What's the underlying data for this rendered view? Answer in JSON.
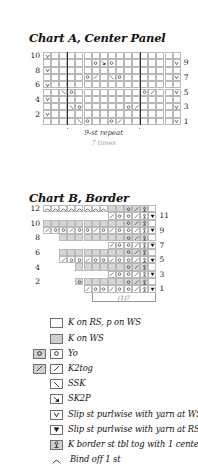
{
  "charts": [
    {
      "id": "chart-a",
      "title": "Chart A, Center Panel",
      "cols": 17,
      "rows": 10,
      "row_numbers_left": [
        "10",
        "8",
        "6",
        "4",
        "2"
      ],
      "row_numbers_right": [
        "9",
        "7",
        "5",
        "3",
        "1"
      ],
      "repeat_label": "9-st repeat",
      "repeat_sublabel": "7 times",
      "repeat_span_cols": [
        3,
        11
      ],
      "grid": [
        {
          "row": 10,
          "side": "WS",
          "cells": [
            "slip-ws",
            "k",
            "k",
            "k",
            "k",
            "k",
            "k",
            "k",
            "k",
            "k",
            "k",
            "k",
            "k",
            "k",
            "k",
            "k",
            "k"
          ]
        },
        {
          "row": 9,
          "side": "RS",
          "cells": [
            "k",
            "k",
            "k",
            "k",
            "k",
            "k",
            "yo",
            "sk2p",
            "yo",
            "k",
            "k",
            "k",
            "k",
            "k",
            "k",
            "k",
            "slip-ws"
          ]
        },
        {
          "row": 8,
          "side": "WS",
          "cells": [
            "slip-ws",
            "k",
            "k",
            "k",
            "k",
            "k",
            "k",
            "k",
            "k",
            "k",
            "k",
            "k",
            "k",
            "k",
            "k",
            "k",
            "k"
          ]
        },
        {
          "row": 7,
          "side": "RS",
          "cells": [
            "k",
            "k",
            "k",
            "k",
            "k",
            "yo",
            "k2tog",
            "k",
            "ssk",
            "yo",
            "k",
            "k",
            "k",
            "k",
            "k",
            "k",
            "slip-ws"
          ]
        },
        {
          "row": 6,
          "side": "WS",
          "cells": [
            "slip-ws",
            "k",
            "k",
            "k",
            "k",
            "k",
            "k",
            "k",
            "k",
            "k",
            "k",
            "k",
            "k",
            "k",
            "k",
            "k",
            "k"
          ]
        },
        {
          "row": 5,
          "side": "RS",
          "cells": [
            "k",
            "k",
            "ssk",
            "yo",
            "k",
            "k",
            "k",
            "k",
            "k",
            "k",
            "k",
            "k",
            "yo",
            "k2tog",
            "k",
            "k",
            "slip-ws"
          ]
        },
        {
          "row": 4,
          "side": "WS",
          "cells": [
            "slip-ws",
            "k",
            "k",
            "k",
            "k",
            "k",
            "k",
            "k",
            "k",
            "k",
            "k",
            "k",
            "k",
            "k",
            "k",
            "k",
            "k"
          ]
        },
        {
          "row": 3,
          "side": "RS",
          "cells": [
            "k",
            "k",
            "k",
            "ssk",
            "yo",
            "k",
            "k",
            "k",
            "k",
            "k",
            "yo",
            "k2tog",
            "k",
            "k",
            "k",
            "k",
            "slip-ws"
          ]
        },
        {
          "row": 2,
          "side": "WS",
          "cells": [
            "slip-ws",
            "k",
            "k",
            "k",
            "k",
            "k",
            "k",
            "k",
            "k",
            "k",
            "k",
            "k",
            "k",
            "k",
            "k",
            "k",
            "k"
          ]
        },
        {
          "row": 1,
          "side": "RS",
          "cells": [
            "k",
            "k",
            "k",
            "k",
            "ssk",
            "yo",
            "k",
            "k",
            "yo",
            "k2tog",
            "k",
            "k",
            "k",
            "k",
            "k",
            "k",
            "slip-ws"
          ]
        }
      ]
    },
    {
      "id": "chart-b",
      "title": "Chart B, Border",
      "cols": 14,
      "rows": 12,
      "row_numbers_left": [
        "12",
        "10",
        "8",
        "6",
        "4",
        "2"
      ],
      "row_numbers_right": [
        "11",
        "9",
        "7",
        "5",
        "3",
        "1"
      ],
      "bottom_label": "(1)7",
      "bottom_span_cols": [
        6,
        13
      ],
      "grid": [
        {
          "row": 12,
          "side": "WS",
          "cells": [
            "bindoff",
            "bindoff",
            "bindoff",
            "bindoff",
            "bindoff",
            "bindoff",
            "bindoff",
            "bindoff",
            "kws",
            "kws",
            "yo",
            "k2tog",
            "ktbl",
            "k"
          ]
        },
        {
          "row": 11,
          "side": "RS",
          "cells": [
            "none",
            "none",
            "none",
            "none",
            "none",
            "none",
            "none",
            "none",
            "k2tog",
            "yo",
            "yo",
            "k2tog",
            "ktbl",
            "slip-rs"
          ]
        },
        {
          "row": 10,
          "side": "WS",
          "cells": [
            "kws",
            "kws",
            "kws",
            "kws",
            "kws",
            "kws",
            "kws",
            "kws",
            "kws",
            "kws",
            "yo",
            "k2tog",
            "ktbl",
            "k"
          ]
        },
        {
          "row": 9,
          "side": "RS",
          "cells": [
            "k2tog",
            "yo",
            "yo",
            "k2tog",
            "yo",
            "yo",
            "k2tog",
            "yo",
            "k2tog",
            "yo",
            "yo",
            "k2tog",
            "ktbl",
            "slip-rs"
          ]
        },
        {
          "row": 8,
          "side": "WS",
          "cells": [
            "none",
            "none",
            "kws",
            "kws",
            "kws",
            "kws",
            "kws",
            "kws",
            "kws",
            "kws",
            "yo",
            "k2tog",
            "ktbl",
            "k"
          ]
        },
        {
          "row": 7,
          "side": "RS",
          "cells": [
            "none",
            "none",
            "none",
            "none",
            "none",
            "none",
            "none",
            "none",
            "k2tog",
            "yo",
            "yo",
            "k2tog",
            "ktbl",
            "slip-rs"
          ]
        },
        {
          "row": 6,
          "side": "WS",
          "cells": [
            "none",
            "none",
            "kws",
            "kws",
            "kws",
            "kws",
            "kws",
            "kws",
            "kws",
            "kws",
            "yo",
            "k2tog",
            "ktbl",
            "k"
          ]
        },
        {
          "row": 5,
          "side": "RS",
          "cells": [
            "none",
            "none",
            "k2tog",
            "yo",
            "yo",
            "k2tog",
            "yo",
            "yo",
            "k2tog",
            "yo",
            "yo",
            "k2tog",
            "ktbl",
            "slip-rs"
          ]
        },
        {
          "row": 4,
          "side": "WS",
          "cells": [
            "none",
            "none",
            "none",
            "none",
            "kws",
            "kws",
            "kws",
            "kws",
            "kws",
            "kws",
            "yo",
            "k2tog",
            "ktbl",
            "k"
          ]
        },
        {
          "row": 3,
          "side": "RS",
          "cells": [
            "none",
            "none",
            "none",
            "none",
            "none",
            "none",
            "none",
            "none",
            "k2tog",
            "yo",
            "yo",
            "k2tog",
            "ktbl",
            "slip-rs"
          ]
        },
        {
          "row": 2,
          "side": "WS",
          "cells": [
            "none",
            "none",
            "none",
            "none",
            "yo",
            "kws",
            "kws",
            "kws",
            "kws",
            "kws",
            "yo",
            "k2tog",
            "ktbl",
            "k"
          ]
        },
        {
          "row": 1,
          "side": "RS",
          "cells": [
            "none",
            "none",
            "none",
            "none",
            "none",
            "k2tog",
            "yo",
            "yo",
            "k2tog",
            "yo",
            "yo",
            "k2tog",
            "ktbl",
            "slip-rs"
          ]
        }
      ]
    }
  ],
  "legend": {
    "items": [
      {
        "symbols": [
          {
            "fill": "white",
            "glyph": ""
          }
        ],
        "text": "K on RS, p on WS"
      },
      {
        "symbols": [
          {
            "fill": "shade",
            "glyph": ""
          }
        ],
        "text": "K on WS"
      },
      {
        "symbols": [
          {
            "fill": "shade",
            "glyph": "yo"
          },
          {
            "fill": "white",
            "glyph": "yo"
          }
        ],
        "text": "Yo"
      },
      {
        "symbols": [
          {
            "fill": "shade",
            "glyph": "k2tog"
          },
          {
            "fill": "white",
            "glyph": "k2tog"
          }
        ],
        "text": "K2tog"
      },
      {
        "symbols": [
          {
            "fill": "white",
            "glyph": "ssk"
          }
        ],
        "text": "SSK"
      },
      {
        "symbols": [
          {
            "fill": "white",
            "glyph": "sk2p"
          }
        ],
        "text": "SK2P"
      },
      {
        "symbols": [
          {
            "fill": "white",
            "glyph": "slip-ws"
          }
        ],
        "text": "Slip st purlwise with yarn at WS"
      },
      {
        "symbols": [
          {
            "fill": "white",
            "glyph": "slip-rs"
          }
        ],
        "text": "Slip st purlwise with yarn at RS"
      },
      {
        "symbols": [
          {
            "fill": "shade",
            "glyph": "ktbl"
          }
        ],
        "text": "K border st tbl tog with 1 center panel st"
      },
      {
        "symbols": [
          {
            "fill": "none",
            "glyph": "bindoff"
          }
        ],
        "text": "Bind off 1 st"
      }
    ]
  },
  "colors": {
    "shade": "#d6d6d6",
    "grid_line": "#b9b9b9",
    "heavy_line": "#2b2b2b",
    "ink": "#111111",
    "muted": "#9a9a9a"
  }
}
